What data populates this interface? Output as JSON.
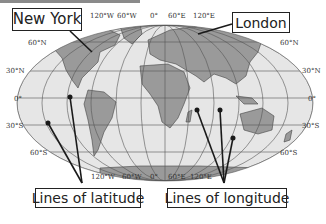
{
  "labels": {
    "new_york": "New York",
    "london": "London",
    "lines_of_latitude": "Lines of latitude",
    "lines_of_longitude": "Lines of longitude"
  },
  "longitude_ticks_top": [
    "120°W",
    "60°W",
    "0°",
    "60°E",
    "120°E"
  ],
  "longitude_ticks_bottom": [
    "120°W",
    "60°W",
    "0°",
    "60°E",
    "120°E"
  ],
  "latitude_ticks_left": [
    "60°N",
    "30°N",
    "0°",
    "30°S",
    "60°S"
  ],
  "latitude_ticks_right": [
    "60°N",
    "30°N",
    "0°",
    "30°S",
    "60°S"
  ],
  "colors": {
    "ocean": "#e6e6e6",
    "land": "#9a9a9a",
    "grid": "#555555",
    "pointer": "#1a1a1a"
  }
}
